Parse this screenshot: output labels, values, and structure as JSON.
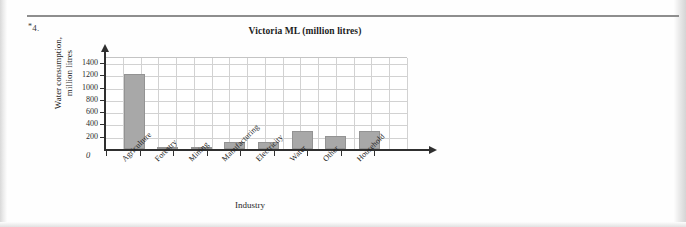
{
  "page": {
    "question_marker": "*4.",
    "question_marker_star": "*",
    "question_marker_number": "4."
  },
  "chart_data": {
    "type": "bar",
    "title": "Victoria ML (million litres)",
    "xlabel": "Industry",
    "ylabel": "Water consumption,\nmillion litres",
    "ylabel_line1": "Water consumption,",
    "ylabel_line2": "million litres",
    "categories": [
      "Agriculture",
      "Forestry",
      "Mining",
      "Manufacturing",
      "Electricity",
      "Water",
      "Other",
      "Household"
    ],
    "values": [
      1230,
      20,
      30,
      120,
      110,
      300,
      210,
      300
    ],
    "ylim": [
      0,
      1500
    ],
    "yticks": [
      0,
      200,
      400,
      600,
      800,
      1000,
      1200,
      1400
    ],
    "ytick_labels": [
      "0",
      "200",
      "400",
      "600",
      "800",
      "1000",
      "1200",
      "1400"
    ],
    "zero_label": "0",
    "grid": true,
    "legend": "none",
    "bar_color": "#a8a8a8",
    "axis_color": "#2f2f2f",
    "grid_color": "#d2d2d2"
  }
}
